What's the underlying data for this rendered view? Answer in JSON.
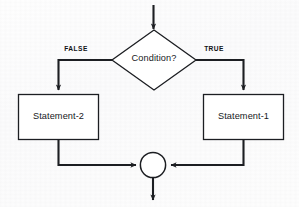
{
  "diagram": {
    "background_color": "#fdfdfd",
    "stroke_color": "#1c1e22",
    "shape_fill": "#ffffff",
    "nodes": {
      "decision": {
        "label": "Condition?",
        "shape": "diamond",
        "cx": 154,
        "cy": 60,
        "half_width": 42,
        "half_height": 30
      },
      "statement_false": {
        "label": "Statement-2",
        "shape": "rectangle",
        "x": 18,
        "y": 94,
        "width": 81,
        "height": 46
      },
      "statement_true": {
        "label": "Statement-1",
        "shape": "rectangle",
        "x": 203,
        "y": 94,
        "width": 81,
        "height": 46
      },
      "merge": {
        "label": "",
        "shape": "circle",
        "cx": 153,
        "cy": 165,
        "r": 13
      }
    },
    "edges": {
      "entry": {
        "label": "",
        "from": "top",
        "to": "decision"
      },
      "false_branch": {
        "label": "FALSE",
        "label_x": 75,
        "label_y": 49,
        "from": "decision",
        "to": "statement_false"
      },
      "true_branch": {
        "label": "TRUE",
        "label_x": 203,
        "label_y": 49,
        "from": "decision",
        "to": "statement_true"
      },
      "false_to_merge": {
        "label": "",
        "from": "statement_false",
        "to": "merge"
      },
      "true_to_merge": {
        "label": "",
        "from": "statement_true",
        "to": "merge"
      },
      "exit": {
        "label": "",
        "from": "merge",
        "to": "bottom"
      }
    }
  }
}
